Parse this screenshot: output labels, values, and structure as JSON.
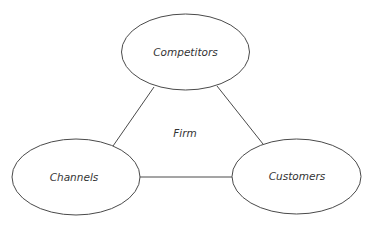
{
  "diagram": {
    "center_label": "Firm",
    "nodes": [
      {
        "id": "competitors",
        "label": "Competitors"
      },
      {
        "id": "channels",
        "label": "Channels"
      },
      {
        "id": "customers",
        "label": "Customers"
      }
    ],
    "edges": [
      {
        "from": "competitors",
        "to": "channels"
      },
      {
        "from": "competitors",
        "to": "customers"
      },
      {
        "from": "channels",
        "to": "customers"
      }
    ]
  },
  "colors": {
    "stroke": "#4a4a4a",
    "text": "#333333",
    "background": "#ffffff"
  }
}
